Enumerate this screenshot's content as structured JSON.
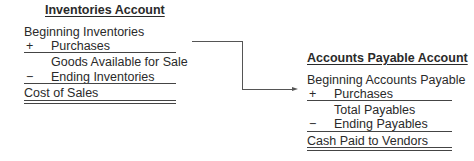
{
  "inventories": {
    "title": "Inventories Account",
    "beginning": "Beginning Inventories",
    "plus_sign": "+",
    "purchases": "Purchases",
    "subtotal": "Goods Available for Sale",
    "minus_sign": "−",
    "ending": "Ending Inventories",
    "result": "Cost of Sales"
  },
  "payables": {
    "title": "Accounts Payable Account",
    "beginning": "Beginning Accounts Payable",
    "plus_sign": "+",
    "purchases": "Purchases",
    "subtotal": "Total Payables",
    "minus_sign": "−",
    "ending": "Ending Payables",
    "result": "Cash Paid to Vendors"
  }
}
